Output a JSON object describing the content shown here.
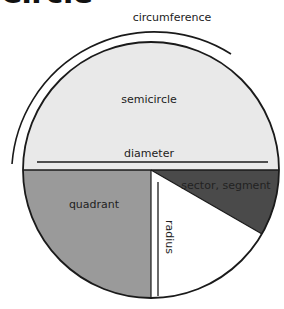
{
  "title": "Circle",
  "labels": {
    "circumference": "circumference",
    "semicircle": "semicircle",
    "diameter": "diameter",
    "quadrant": "quadrant",
    "sector_segment": "sector, segment",
    "radius": "radius"
  },
  "colors": {
    "semicircle_fill": "#e9e9e9",
    "quadrant_fill": "#9a9a9a",
    "sector_fill": "#4a4a4a",
    "radius_region_fill": "#ffffff",
    "stroke": "#1a1a1a"
  }
}
